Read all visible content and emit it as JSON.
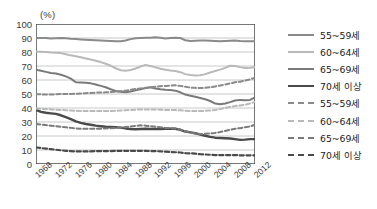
{
  "chart_data": {
    "type": "line",
    "title": "",
    "xlabel": "",
    "ylabel": "(%)",
    "unit_label": "(%)",
    "ylim": [
      0,
      100
    ],
    "ytick_step": 10,
    "yticks": [
      0,
      10,
      20,
      30,
      40,
      50,
      60,
      70,
      80,
      90,
      100
    ],
    "grid": true,
    "legend_position": "right",
    "x": [
      1968,
      1969,
      1970,
      1971,
      1972,
      1973,
      1974,
      1975,
      1976,
      1977,
      1978,
      1979,
      1980,
      1981,
      1982,
      1983,
      1984,
      1985,
      1986,
      1987,
      1988,
      1989,
      1990,
      1991,
      1992,
      1993,
      1994,
      1995,
      1996,
      1997,
      1998,
      1999,
      2000,
      2001,
      2002,
      2003,
      2004,
      2005,
      2006,
      2007,
      2008,
      2009,
      2010,
      2011,
      2012
    ],
    "xticks": [
      1968,
      1972,
      1976,
      1980,
      1984,
      1988,
      1992,
      1996,
      2000,
      2004,
      2008,
      2012
    ],
    "xtick_labels": [
      "1968",
      "1972",
      "1976",
      "1980",
      "1984",
      "1988",
      "1992",
      "1996",
      "2000",
      "2004",
      "2008",
      "2012"
    ],
    "colors": {
      "solid_55_59": "#8a8a8a",
      "solid_60_64": "#b9b9b9",
      "solid_65_69": "#7a7a7a",
      "solid_70_plus": "#4a4a4a",
      "dashed_55_59": "#8a8a8a",
      "dashed_60_64": "#b9b9b9",
      "dashed_65_69": "#7a7a7a",
      "dashed_70_plus": "#4a4a4a",
      "grid": "#9a9a9a",
      "axis": "#555555",
      "text": "#333333"
    },
    "series": [
      {
        "name": "55~59세",
        "style": "solid",
        "color": "#8a8a8a",
        "width": 2.0,
        "values": [
          90,
          90,
          90,
          89.6,
          89.8,
          90,
          89.8,
          89.4,
          89.2,
          89,
          88.8,
          88.6,
          88.4,
          88.2,
          88,
          87.8,
          87.6,
          87.6,
          88.2,
          89.2,
          89.8,
          90,
          90.2,
          90.2,
          90.6,
          90.2,
          89.6,
          90,
          90.2,
          90,
          88.4,
          87.8,
          88,
          88.2,
          88.2,
          88,
          87.8,
          87.6,
          87.8,
          88,
          88.2,
          87.8,
          87.6,
          87.6,
          87.6
        ]
      },
      {
        "name": "60~64세",
        "style": "solid",
        "color": "#b9b9b9",
        "width": 2.0,
        "values": [
          80.4,
          80.2,
          80,
          79.6,
          79.4,
          79.2,
          78.4,
          77.6,
          77,
          76.2,
          75.4,
          74.6,
          73.8,
          72.8,
          71.6,
          70.2,
          68.4,
          67,
          66.6,
          67.2,
          68.2,
          69.6,
          70.8,
          70,
          69,
          68,
          67.4,
          66.8,
          66.4,
          65.6,
          64.2,
          63.6,
          63.2,
          63.4,
          64.2,
          65.4,
          66.4,
          67.4,
          68.6,
          70.2,
          70,
          69.2,
          68.6,
          68.8,
          69.2
        ]
      },
      {
        "name": "65~69세",
        "style": "solid",
        "color": "#7a7a7a",
        "width": 2.0,
        "values": [
          67.4,
          66.6,
          65.8,
          65,
          64.6,
          63.8,
          62.6,
          61,
          58.4,
          58.2,
          58,
          57.6,
          56.8,
          55.8,
          54.8,
          53.4,
          52.2,
          51.6,
          51.2,
          51.8,
          52.6,
          53.4,
          54.2,
          54.8,
          54,
          53.4,
          53,
          52.8,
          52.4,
          51.2,
          49.6,
          48.8,
          48,
          47.2,
          46.2,
          45,
          43.2,
          42.6,
          43.2,
          44.2,
          45.4,
          45.8,
          45.6,
          45.8,
          47.6
        ]
      },
      {
        "name": "70세 이상",
        "style": "solid",
        "color": "#4a4a4a",
        "width": 2.4,
        "values": [
          38.6,
          37.2,
          36.6,
          36.2,
          35.8,
          34.8,
          33.4,
          32,
          30.4,
          29.4,
          28.6,
          28,
          27.4,
          27,
          26.6,
          26.4,
          26.2,
          26,
          25.4,
          25,
          24.8,
          25,
          25.2,
          25,
          25,
          25,
          25.2,
          25.2,
          25.2,
          24.4,
          23.2,
          22.6,
          22,
          21,
          20.2,
          19.4,
          18.8,
          18.6,
          18.4,
          18.2,
          17.8,
          17.2,
          17.4,
          17.8,
          17.8
        ]
      },
      {
        "name": "55~59세",
        "style": "dashed",
        "color": "#8a8a8a",
        "width": 2.0,
        "values": [
          49.8,
          49.8,
          49.6,
          49.6,
          49.8,
          50,
          50,
          50,
          50.2,
          50.4,
          50.6,
          50.8,
          51,
          51,
          51.2,
          51.4,
          51.6,
          52,
          52.4,
          53,
          53.6,
          54,
          54.4,
          54.8,
          55.2,
          55.6,
          55.8,
          56,
          56.2,
          55.8,
          55.2,
          54.6,
          54.4,
          54.2,
          54.4,
          54.8,
          55.4,
          56,
          56.8,
          57.6,
          58.4,
          58.8,
          59.6,
          60.4,
          61.6
        ]
      },
      {
        "name": "60~64세",
        "style": "dashed",
        "color": "#b9b9b9",
        "width": 2.0,
        "values": [
          39.6,
          39.4,
          39.2,
          39,
          38.8,
          38.6,
          38.4,
          38.2,
          38,
          37.8,
          37.8,
          37.8,
          37.8,
          37.8,
          37.8,
          37.8,
          38,
          38.2,
          38.4,
          38.6,
          38.8,
          39,
          39,
          39,
          39,
          38.8,
          38.6,
          38.6,
          38.6,
          38.4,
          38,
          37.8,
          37.8,
          37.8,
          38,
          38.2,
          38.6,
          39.2,
          40,
          40.8,
          41.4,
          41.8,
          42.4,
          43.2,
          44.4
        ]
      },
      {
        "name": "65~69세",
        "style": "dashed",
        "color": "#7a7a7a",
        "width": 2.0,
        "values": [
          28.6,
          28.2,
          27.8,
          27.4,
          27,
          26.6,
          26.2,
          25.8,
          25.4,
          25.2,
          25.2,
          25.2,
          25.2,
          25.2,
          25.4,
          25.6,
          25.8,
          26,
          26.4,
          26.8,
          27.2,
          27.6,
          27.4,
          27,
          26.6,
          26.2,
          25.8,
          25.6,
          25.4,
          24.6,
          23.4,
          22.6,
          21.8,
          21.4,
          21.6,
          21.8,
          22.2,
          22.8,
          23.6,
          24.4,
          25.2,
          25.6,
          26.2,
          26.8,
          28
        ]
      },
      {
        "name": "70세 이상",
        "style": "dashed",
        "color": "#4a4a4a",
        "width": 2.2,
        "values": [
          11.8,
          11.4,
          11,
          10.6,
          10.2,
          9.8,
          9.4,
          9.2,
          9,
          9,
          9,
          9,
          9.2,
          9.2,
          9.2,
          9.2,
          9.4,
          9.4,
          9.4,
          9.4,
          9.4,
          9.4,
          9.4,
          9.2,
          9.2,
          9,
          8.8,
          8.6,
          8.4,
          8.2,
          7.8,
          7.6,
          7.4,
          7,
          6.8,
          6.6,
          6.4,
          6.4,
          6.4,
          6.4,
          6.4,
          6.2,
          6.2,
          6.2,
          6.2
        ]
      }
    ]
  },
  "legend": {
    "items": [
      {
        "label": "55~59세",
        "style": "solid",
        "color": "#8a8a8a"
      },
      {
        "label": "60~64세",
        "style": "solid",
        "color": "#b9b9b9"
      },
      {
        "label": "65~69세",
        "style": "solid",
        "color": "#7a7a7a"
      },
      {
        "label": "70세 이상",
        "style": "solid",
        "color": "#4a4a4a"
      },
      {
        "label": "55~59세",
        "style": "dashed",
        "color": "#8a8a8a"
      },
      {
        "label": "60~64세",
        "style": "dashed",
        "color": "#b9b9b9"
      },
      {
        "label": "65~69세",
        "style": "dashed",
        "color": "#7a7a7a"
      },
      {
        "label": "70세 이상",
        "style": "dashed",
        "color": "#4a4a4a"
      }
    ]
  }
}
